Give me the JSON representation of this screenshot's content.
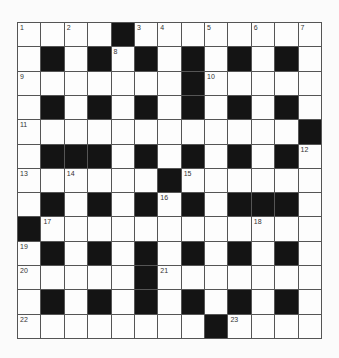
{
  "puzzle": {
    "rows": 13,
    "cols": 13,
    "colors": {
      "block": "#141414",
      "cell": "#fdfdfd",
      "border": "#555555"
    },
    "grid": [
      "....#........",
      ".#.#.#.#.#.#.",
      ".......#.....",
      ".#.#.#.#.#.#.",
      "............#",
      ".###.#.#.#.#.",
      "......#......",
      ".#.#.#.#.###.",
      "#............",
      ".#.#.#.#.#.#.",
      ".....#.......",
      ".#.#.#.#.#.#.",
      "........#...."
    ],
    "numbers": [
      {
        "n": "1",
        "r": 0,
        "c": 0
      },
      {
        "n": "2",
        "r": 0,
        "c": 2
      },
      {
        "n": "3",
        "r": 0,
        "c": 5
      },
      {
        "n": "4",
        "r": 0,
        "c": 6
      },
      {
        "n": "5",
        "r": 0,
        "c": 8
      },
      {
        "n": "6",
        "r": 0,
        "c": 10
      },
      {
        "n": "7",
        "r": 0,
        "c": 12
      },
      {
        "n": "8",
        "r": 1,
        "c": 4
      },
      {
        "n": "9",
        "r": 2,
        "c": 0
      },
      {
        "n": "10",
        "r": 2,
        "c": 8
      },
      {
        "n": "11",
        "r": 4,
        "c": 0
      },
      {
        "n": "12",
        "r": 5,
        "c": 12
      },
      {
        "n": "13",
        "r": 6,
        "c": 0
      },
      {
        "n": "14",
        "r": 6,
        "c": 2
      },
      {
        "n": "15",
        "r": 6,
        "c": 7
      },
      {
        "n": "16",
        "r": 7,
        "c": 6
      },
      {
        "n": "17",
        "r": 8,
        "c": 1
      },
      {
        "n": "18",
        "r": 8,
        "c": 10
      },
      {
        "n": "19",
        "r": 9,
        "c": 0
      },
      {
        "n": "20",
        "r": 10,
        "c": 0
      },
      {
        "n": "21",
        "r": 10,
        "c": 6
      },
      {
        "n": "22",
        "r": 12,
        "c": 0
      },
      {
        "n": "23",
        "r": 12,
        "c": 9
      }
    ]
  }
}
